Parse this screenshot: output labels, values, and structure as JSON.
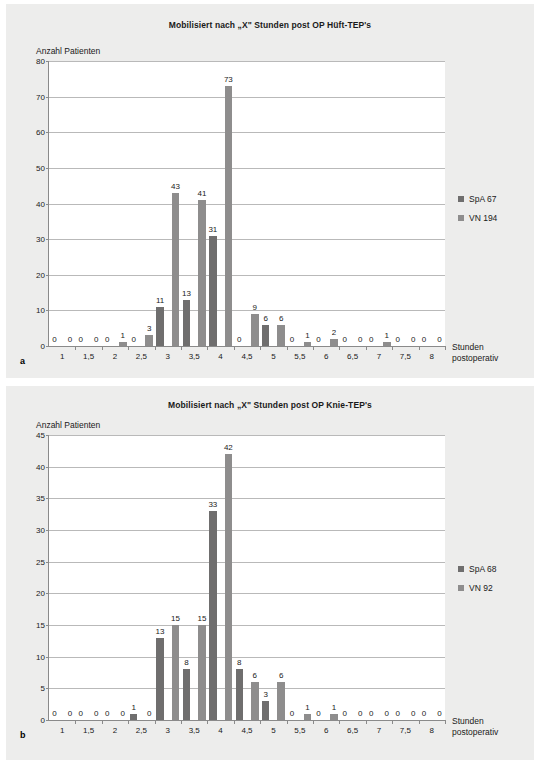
{
  "figure": {
    "panels": [
      {
        "letter": "a",
        "title": "Mobilisiert nach „X\" Stunden post OP Hüft-TEP's",
        "ylabel": "Anzahl Patienten",
        "xlabel_line1": "Stunden",
        "xlabel_line2": "postoperativ",
        "legend": [
          {
            "label": "SpA 67",
            "color": "#6f6e6e"
          },
          {
            "label": "VN 194",
            "color": "#8e8d8d"
          }
        ],
        "chart_data": {
          "type": "bar",
          "title": "Mobilisiert nach „X\" Stunden post OP Hüft-TEP's",
          "xlabel": "Stunden postoperativ",
          "ylabel": "Anzahl Patienten",
          "ylim": [
            0,
            80
          ],
          "yticks": [
            0,
            10,
            20,
            30,
            40,
            50,
            60,
            70,
            80
          ],
          "grid": true,
          "legend_position": "right",
          "categories": [
            "1",
            "1,5",
            "2",
            "2,5",
            "3",
            "3,5",
            "4",
            "4,5",
            "5",
            "5,5",
            "6",
            "6,5",
            "7",
            "7,5",
            "8"
          ],
          "series": [
            {
              "name": "SpA 67",
              "color": "#6f6e6e",
              "values": [
                0,
                0,
                0,
                0,
                11,
                13,
                31,
                0,
                6,
                0,
                0,
                0,
                0,
                0,
                0
              ]
            },
            {
              "name": "VN 194",
              "color": "#8e8d8d",
              "values": [
                0,
                0,
                1,
                3,
                43,
                41,
                73,
                9,
                6,
                1,
                2,
                0,
                1,
                0,
                0
              ]
            }
          ]
        }
      },
      {
        "letter": "b",
        "title": "Mobilisiert nach „X\" Stunden post OP Knie-TEP's",
        "ylabel": "Anzahl Patienten",
        "xlabel_line1": "Stunden",
        "xlabel_line2": "postoperativ",
        "legend": [
          {
            "label": "SpA 68",
            "color": "#6f6e6e"
          },
          {
            "label": "VN 92",
            "color": "#8e8d8d"
          }
        ],
        "chart_data": {
          "type": "bar",
          "title": "Mobilisiert nach „X\" Stunden post OP Knie-TEP's",
          "xlabel": "Stunden postoperativ",
          "ylabel": "Anzahl Patienten",
          "ylim": [
            0,
            45
          ],
          "yticks": [
            0,
            5,
            10,
            15,
            20,
            25,
            30,
            35,
            40,
            45
          ],
          "grid": true,
          "legend_position": "right",
          "categories": [
            "1",
            "1,5",
            "2",
            "2,5",
            "3",
            "3,5",
            "4",
            "4,5",
            "5",
            "5,5",
            "6",
            "6,5",
            "7",
            "7,5",
            "8"
          ],
          "series": [
            {
              "name": "SpA 68",
              "color": "#6f6e6e",
              "values": [
                0,
                0,
                0,
                1,
                13,
                8,
                33,
                8,
                3,
                0,
                0,
                0,
                0,
                0,
                0
              ]
            },
            {
              "name": "VN 92",
              "color": "#8e8d8d",
              "values": [
                0,
                0,
                0,
                0,
                15,
                15,
                42,
                6,
                6,
                1,
                1,
                0,
                0,
                0,
                0
              ]
            }
          ]
        }
      }
    ]
  }
}
